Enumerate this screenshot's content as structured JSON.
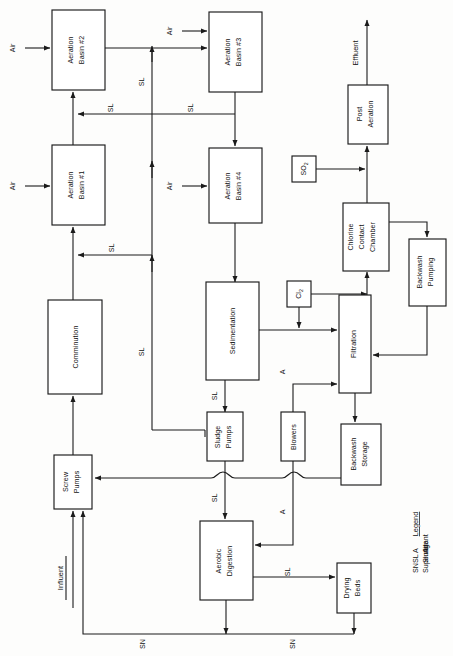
{
  "diagram": {
    "type": "process-flow-diagram",
    "orientation_note": "page rotated 90 degrees counter-clockwise; all text reads bottom-to-top",
    "nodes": [
      {
        "id": "aeration2",
        "label": "Aeration\nBasin #2",
        "line1": "Aeration",
        "line2": "Basin #2",
        "x": 52,
        "y": 10,
        "w": 53,
        "h": 80
      },
      {
        "id": "aeration1",
        "label": "Aeration\nBasin #1",
        "line1": "Aeration",
        "line2": "Basin #1",
        "x": 52,
        "y": 145,
        "w": 53,
        "h": 80
      },
      {
        "id": "comminution",
        "label": "Comminution",
        "line1": "Comminution",
        "line2": "",
        "x": 48,
        "y": 300,
        "w": 54,
        "h": 94
      },
      {
        "id": "screwpumps",
        "label": "Screw\nPumps",
        "line1": "Screw",
        "line2": "Pumps",
        "x": 54,
        "y": 455,
        "w": 38,
        "h": 54
      },
      {
        "id": "aeration3",
        "label": "Aeration\nBasin #3",
        "line1": "Aeration",
        "line2": "Basin #3",
        "x": 209,
        "y": 12,
        "w": 53,
        "h": 80
      },
      {
        "id": "aeration4",
        "label": "Aeration\nBasin #4",
        "line1": "Aeration",
        "line2": "Basin #4",
        "x": 209,
        "y": 148,
        "w": 53,
        "h": 75
      },
      {
        "id": "sedimentation",
        "label": "Sedimentation",
        "line1": "Sedimentation",
        "line2": "",
        "x": 206,
        "y": 282,
        "w": 53,
        "h": 98
      },
      {
        "id": "sludgepumps",
        "label": "Sludge\nPumps",
        "line1": "Sludge",
        "line2": "Pumps",
        "x": 207,
        "y": 412,
        "w": 36,
        "h": 49
      },
      {
        "id": "aerobicdig",
        "label": "Aerobic\nDigestion",
        "line1": "Aerobic",
        "line2": "Digestion",
        "x": 200,
        "y": 521,
        "w": 53,
        "h": 79
      },
      {
        "id": "blowers",
        "label": "Blowers",
        "line1": "Blowers",
        "line2": "",
        "x": 281,
        "y": 412,
        "w": 24,
        "h": 49
      },
      {
        "id": "cl2",
        "label": "Cl2",
        "line1": "Cl",
        "line2": "",
        "sub": "2",
        "x": 287,
        "y": 281,
        "w": 24,
        "h": 26
      },
      {
        "id": "so2",
        "label": "SO2",
        "line1": "SO",
        "line2": "",
        "sub": "2",
        "x": 292,
        "y": 156,
        "w": 24,
        "h": 26
      },
      {
        "id": "filtration",
        "label": "Filtration",
        "line1": "Filtration",
        "line2": "",
        "x": 339,
        "y": 295,
        "w": 32,
        "h": 98
      },
      {
        "id": "backwashstorage",
        "label": "Backwash\nStorage",
        "line1": "Backwash",
        "line2": "Storage",
        "x": 341,
        "y": 424,
        "w": 40,
        "h": 61
      },
      {
        "id": "backwashpumping",
        "label": "Backwash\nPumping",
        "line1": "Backwash",
        "line2": "Pumping",
        "x": 409,
        "y": 239,
        "w": 37,
        "h": 67
      },
      {
        "id": "chlorinecontact",
        "label": "Chlorine\nContact\nChamber",
        "line1": "Chlorine",
        "line2": "Contact",
        "line3": "Chamber",
        "x": 343,
        "y": 203,
        "w": 46,
        "h": 68
      },
      {
        "id": "postaeration",
        "label": "Post\nAeration",
        "line1": "Post",
        "line2": "Aeration",
        "x": 348,
        "y": 85,
        "w": 40,
        "h": 59
      },
      {
        "id": "dryingbeds",
        "label": "Drying\nBeds",
        "line1": "Drying",
        "line2": "Beds",
        "x": 337,
        "y": 563,
        "w": 34,
        "h": 50
      }
    ],
    "terminals": [
      {
        "id": "influent",
        "label": "Influent",
        "underlined": true
      },
      {
        "id": "effluent",
        "label": "Effluent",
        "underlined": false
      }
    ],
    "flow_labels": {
      "air": "Air",
      "sludge": "SL",
      "supernatant": "SN",
      "air_short": "A"
    },
    "air_inlets": [
      {
        "target": "aeration1"
      },
      {
        "target": "aeration2"
      },
      {
        "target": "aeration3"
      },
      {
        "target": "aeration4"
      }
    ],
    "legend": {
      "heading": "Legend",
      "entries": [
        {
          "code": "A",
          "meaning": "Air"
        },
        {
          "code": "SL",
          "meaning": "Sludge"
        },
        {
          "code": "SN",
          "meaning": "Supernatant"
        }
      ]
    },
    "colors": {
      "background": "#fdfdfc",
      "stroke": "#1a1a1a",
      "box_fill": "#ffffff",
      "text": "#111111"
    }
  }
}
